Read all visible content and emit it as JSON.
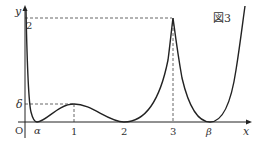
{
  "figure": {
    "caption": "図3",
    "axes": {
      "x_label": "x",
      "y_label": "y",
      "origin_label": "O"
    },
    "x_ticks": [
      {
        "label": "α",
        "italic": true
      },
      {
        "label": "1",
        "italic": false
      },
      {
        "label": "2",
        "italic": false
      },
      {
        "label": "3",
        "italic": false
      },
      {
        "label": "β",
        "italic": true
      }
    ],
    "y_ticks": [
      {
        "label": "2"
      },
      {
        "label": "δ"
      }
    ],
    "colors": {
      "curve": "#222222",
      "axis": "#222222",
      "dashed": "#555555",
      "background": "#ffffff"
    }
  }
}
